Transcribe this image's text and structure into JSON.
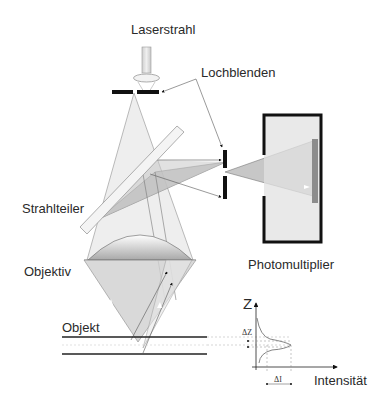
{
  "diagram": {
    "labels": {
      "laser": "Laserstrahl",
      "pinholes": "Lochblenden",
      "beam_splitter": "Strahlteiler",
      "objective": "Objektiv",
      "object": "Objekt",
      "detector": "Photomultiplier"
    },
    "graph": {
      "z_axis": "Z",
      "x_axis": "Intensität",
      "delta_z": "ΔZ",
      "delta_i": "ΔI"
    },
    "colors": {
      "outline": "#1a1a1a",
      "beam_light": "#d9d9d9",
      "beam_mid": "#bdbdbd",
      "beam_dark": "#9a9a9a",
      "detector_fill": "#d6d6d6",
      "detector_strip": "#8c8c8c"
    }
  }
}
